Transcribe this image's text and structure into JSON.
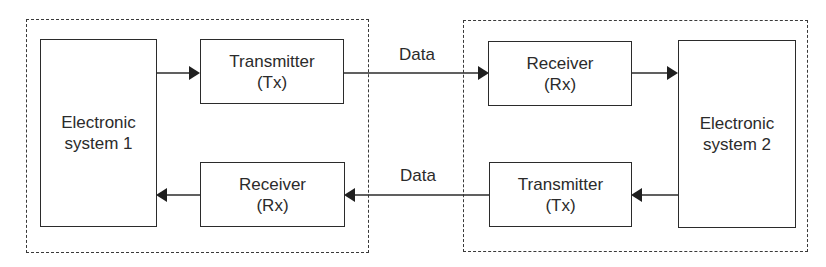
{
  "diagram": {
    "subsystems": [
      {
        "id": "left",
        "name": "electronic-system-1-group"
      },
      {
        "id": "right",
        "name": "electronic-system-2-group"
      }
    ],
    "blocks": {
      "es1": {
        "line1": "Electronic",
        "line2": "system 1"
      },
      "es2": {
        "line1": "Electronic",
        "line2": "system 2"
      },
      "tx_top": {
        "line1": "Transmitter",
        "line2": "(Tx)"
      },
      "rx_top": {
        "line1": "Receiver",
        "line2": "(Rx)"
      },
      "rx_bottom": {
        "line1": "Receiver",
        "line2": "(Rx)"
      },
      "tx_bottom": {
        "line1": "Transmitter",
        "line2": "(Tx)"
      }
    },
    "links": {
      "top_label": "Data",
      "bottom_label": "Data"
    },
    "colors": {
      "line": "#2b2b2b",
      "dashed": "#3a3a3a",
      "background": "#ffffff"
    }
  }
}
